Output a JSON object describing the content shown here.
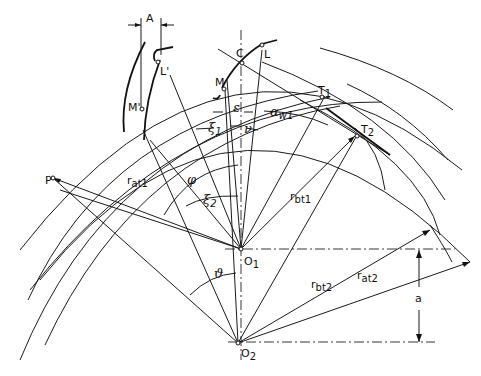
{
  "figure": {
    "type": "gear-meshing-geometry-diagram",
    "labels": {
      "A": "A",
      "L_prime": "L'",
      "M_prime": "M'",
      "C": "C",
      "L": "L",
      "M": "M",
      "epsilon": "ε",
      "alpha_w1_base": "α",
      "alpha_w1_sub": "w1",
      "T1_base": "T",
      "T1_sub": "1",
      "T2_base": "T",
      "T2_sub": "2",
      "xi1_base": "ξ",
      "xi1_sub": "1",
      "nu": "ν",
      "xi2_base": "ξ",
      "xi2_sub": "2",
      "phi": "φ",
      "P": "P",
      "r_at1_base": "r",
      "r_at1_sub": "at1",
      "r_bt1_base": "r",
      "r_bt1_sub": "bt1",
      "O1_base": "O",
      "O1_sub": "1",
      "theta": "ϑ",
      "r_bt2_base": "r",
      "r_bt2_sub": "bt2",
      "r_at2_base": "r",
      "r_at2_sub": "at2",
      "a": "a",
      "O2_base": "O",
      "O2_sub": "2"
    },
    "colors": {
      "line": "#1a1a1a",
      "background": "#ffffff"
    }
  }
}
